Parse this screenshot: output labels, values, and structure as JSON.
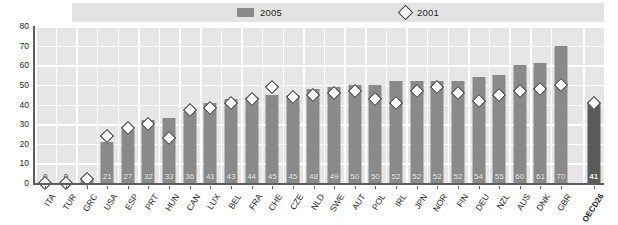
{
  "legend": {
    "items": [
      {
        "label": "2005",
        "marker": "bar-swatch",
        "color": "#8a8a8a"
      },
      {
        "label": "2001",
        "marker": "diamond-marker",
        "color": "#ffffff"
      }
    ]
  },
  "chart_data": {
    "type": "bar",
    "title": "",
    "subtitle": "",
    "xlabel": "",
    "ylabel": "",
    "ylim": [
      0,
      80
    ],
    "yticks": [
      0,
      10,
      20,
      30,
      40,
      50,
      60,
      70,
      80
    ],
    "grid": true,
    "legend_position": "top",
    "categories": [
      "ITA",
      "TUR",
      "GRC",
      "USA",
      "ESP",
      "PRT",
      "HUN",
      "CAN",
      "LUX",
      "BEL",
      "FRA",
      "CHE",
      "CZE",
      "NLD",
      "SWE",
      "AUT",
      "POL",
      "IRL",
      "JPN",
      "NOR",
      "FIN",
      "DEU",
      "NZL",
      "AUS",
      "DNK",
      "GBR",
      "OECD26"
    ],
    "series": [
      {
        "name": "2005",
        "type": "bar",
        "values": [
          0,
          0,
          2,
          21,
          27,
          32,
          33,
          36,
          41,
          43,
          44,
          45,
          45,
          48,
          49,
          50,
          50,
          52,
          52,
          52,
          52,
          54,
          55,
          60,
          61,
          70,
          41
        ],
        "data_labels": [
          "0",
          "0",
          "2",
          "21",
          "27",
          "32",
          "33",
          "36",
          "41",
          "43",
          "44",
          "45",
          "45",
          "48",
          "49",
          "50",
          "50",
          "52",
          "52",
          "52",
          "52",
          "54",
          "55",
          "60",
          "61",
          "70",
          "41"
        ]
      },
      {
        "name": "2001",
        "type": "scatter",
        "values": [
          0,
          0,
          2,
          24,
          28,
          30,
          23,
          37,
          38,
          41,
          43,
          49,
          44,
          45,
          46,
          47,
          43,
          41,
          47,
          49,
          46,
          42,
          45,
          47,
          48,
          50,
          41
        ]
      }
    ],
    "highlight_category": "OECD26"
  }
}
